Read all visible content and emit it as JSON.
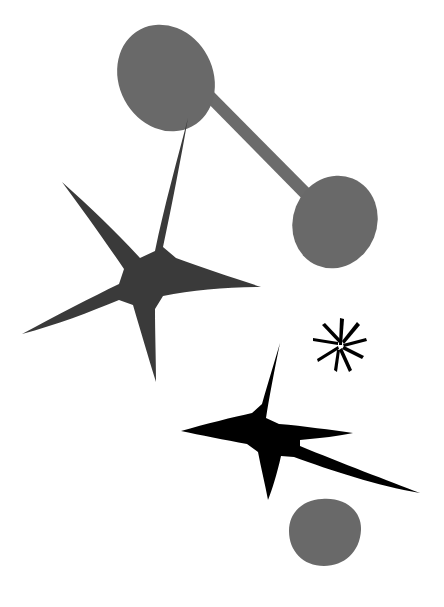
{
  "canvas": {
    "width": 444,
    "height": 607,
    "background_color": "#ffffff",
    "title": "Abstract Composition"
  },
  "palette": {
    "background": "#ffffff",
    "gray": "#696969",
    "gray_alt": "#6b6b6b",
    "charcoal": "#3a3a3a",
    "black": "#000000",
    "edge_remnant": "#b8b8b8"
  },
  "figure": {
    "type": "abstract-illustration",
    "style": "flat silhouette shapes, mobile-like composition",
    "shape_count": 7,
    "shapes": [
      {
        "id": "ellipse-top-left",
        "name": "tilted-gray-ellipse-upper-left",
        "kind": "ellipse",
        "color": "#696969",
        "cx": 166,
        "cy": 78,
        "rx": 47,
        "ry": 55,
        "rotation_deg": -28
      },
      {
        "id": "connector-bar",
        "name": "diagonal-connector-bar",
        "kind": "bar",
        "color": "#6b6b6b",
        "x1": 196,
        "y1": 92,
        "x2": 318,
        "y2": 196,
        "thickness": 9
      },
      {
        "id": "ellipse-right",
        "name": "tilted-gray-ellipse-right",
        "kind": "ellipse",
        "color": "#696969",
        "cx": 335,
        "cy": 222,
        "rx": 42,
        "ry": 47,
        "rotation_deg": 22
      },
      {
        "id": "star-upper",
        "name": "five-pointed-charcoal-star",
        "kind": "star",
        "color": "#3a3a3a",
        "center_x": 152,
        "center_y": 281,
        "points": 5,
        "arm_tips": [
          {
            "label": "top",
            "x": 188,
            "y": 118
          },
          {
            "label": "left",
            "x": 62,
            "y": 182
          },
          {
            "label": "right",
            "x": 261,
            "y": 287
          },
          {
            "label": "lower-left",
            "x": 22,
            "y": 334
          },
          {
            "label": "bottom",
            "x": 156,
            "y": 382
          }
        ]
      },
      {
        "id": "star-lower",
        "name": "four-pointed-black-star",
        "kind": "star",
        "color": "#000000",
        "center_x": 272,
        "center_y": 428,
        "points": 5,
        "arm_tips": [
          {
            "label": "top",
            "x": 280,
            "y": 343
          },
          {
            "label": "left",
            "x": 181,
            "y": 431
          },
          {
            "label": "right",
            "x": 353,
            "y": 433
          },
          {
            "label": "bottom",
            "x": 268,
            "y": 500
          },
          {
            "label": "long-diagonal",
            "x": 420,
            "y": 493
          }
        ]
      },
      {
        "id": "asterisk",
        "name": "small-black-asterisk",
        "kind": "asterisk",
        "color": "#000000",
        "center_x": 341,
        "center_y": 343,
        "radius": 26,
        "spokes": 9
      },
      {
        "id": "blob-bottom",
        "name": "gray-rounded-blob",
        "kind": "blob",
        "color": "#696969",
        "center_x": 325,
        "center_y": 532,
        "rx": 36,
        "ry": 33
      }
    ]
  },
  "edge_artifacts": {
    "description": "faint clipped ink marks along the top edge of the scan",
    "count": 8
  }
}
